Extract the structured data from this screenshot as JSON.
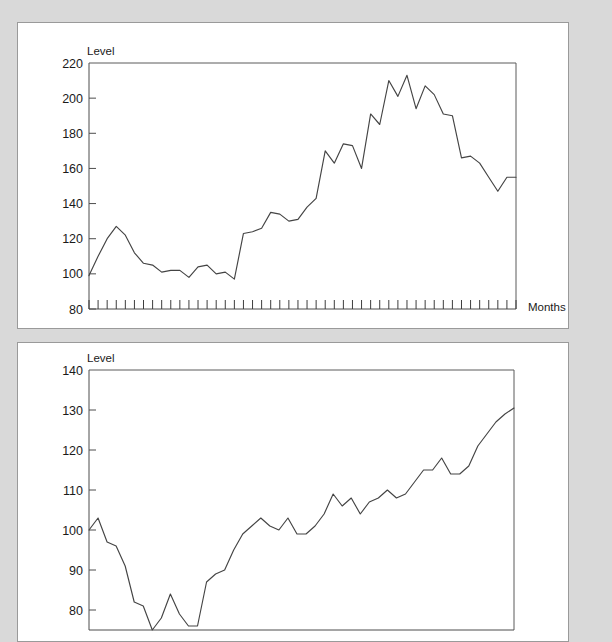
{
  "page": {
    "background_color": "#d9d9d9",
    "panel_background_color": "#ffffff",
    "line_color": "#444444",
    "axis_color": "#4d4d4d"
  },
  "panels": [
    {
      "name": "upper-chart-panel",
      "y_axis_label": "Level",
      "x_axis_label": "Months",
      "y_ticks": [
        "220",
        "200",
        "180",
        "160",
        "140",
        "120",
        "100",
        "80"
      ]
    },
    {
      "name": "lower-chart-panel",
      "y_axis_label": "Level",
      "x_axis_label": "",
      "y_ticks": [
        "140",
        "130",
        "120",
        "110",
        "100",
        "90",
        "80"
      ]
    }
  ],
  "chart_data": [
    {
      "type": "line",
      "name": "upper-chart",
      "title": "",
      "xlabel": "Months",
      "ylabel": "Level",
      "ylim": [
        80,
        220
      ],
      "xlim": [
        0,
        47
      ],
      "ytick_values": [
        220,
        200,
        180,
        160,
        140,
        120,
        100,
        80
      ],
      "grid": false,
      "legend": "none",
      "x_tick_count": 48,
      "x": [
        0,
        1,
        2,
        3,
        4,
        5,
        6,
        7,
        8,
        9,
        10,
        11,
        12,
        13,
        14,
        15,
        16,
        17,
        18,
        19,
        20,
        21,
        22,
        23,
        24,
        25,
        26,
        27,
        28,
        29,
        30,
        31,
        32,
        33,
        34,
        35,
        36,
        37,
        38,
        39,
        40,
        41,
        42,
        43,
        44,
        45,
        46,
        47
      ],
      "values": [
        99,
        110,
        120,
        127,
        122,
        112,
        106,
        105,
        101,
        102,
        102,
        98,
        104,
        105,
        100,
        101,
        97,
        123,
        124,
        126,
        135,
        134,
        130,
        131,
        138,
        143,
        170,
        163,
        174,
        173,
        160,
        191,
        185,
        210,
        201,
        213,
        194,
        207,
        202,
        191,
        190,
        166,
        167,
        163,
        155,
        147,
        155,
        155
      ]
    },
    {
      "type": "line",
      "name": "lower-chart",
      "title": "",
      "xlabel": "",
      "ylabel": "Level",
      "ylim": [
        75,
        140
      ],
      "xlim": [
        0,
        47
      ],
      "ytick_values": [
        140,
        130,
        120,
        110,
        100,
        90,
        80
      ],
      "grid": false,
      "legend": "none",
      "x": [
        0,
        1,
        2,
        3,
        4,
        5,
        6,
        7,
        8,
        9,
        10,
        11,
        12,
        13,
        14,
        15,
        16,
        17,
        18,
        19,
        20,
        21,
        22,
        23,
        24,
        25,
        26,
        27,
        28,
        29,
        30,
        31,
        32,
        33,
        34,
        35,
        36,
        37,
        38,
        39,
        40,
        41,
        42,
        43,
        44,
        45,
        46,
        47
      ],
      "values": [
        100,
        103,
        97,
        96,
        91,
        82,
        81,
        75,
        78,
        84,
        79,
        76,
        76,
        87,
        89,
        90,
        95,
        99,
        101,
        103,
        101,
        100,
        103,
        99,
        99,
        101,
        104,
        109,
        106,
        108,
        104,
        107,
        108,
        110,
        108,
        109,
        112,
        115,
        115,
        118,
        114,
        114,
        116,
        121,
        124,
        127,
        129,
        130.5
      ]
    }
  ]
}
